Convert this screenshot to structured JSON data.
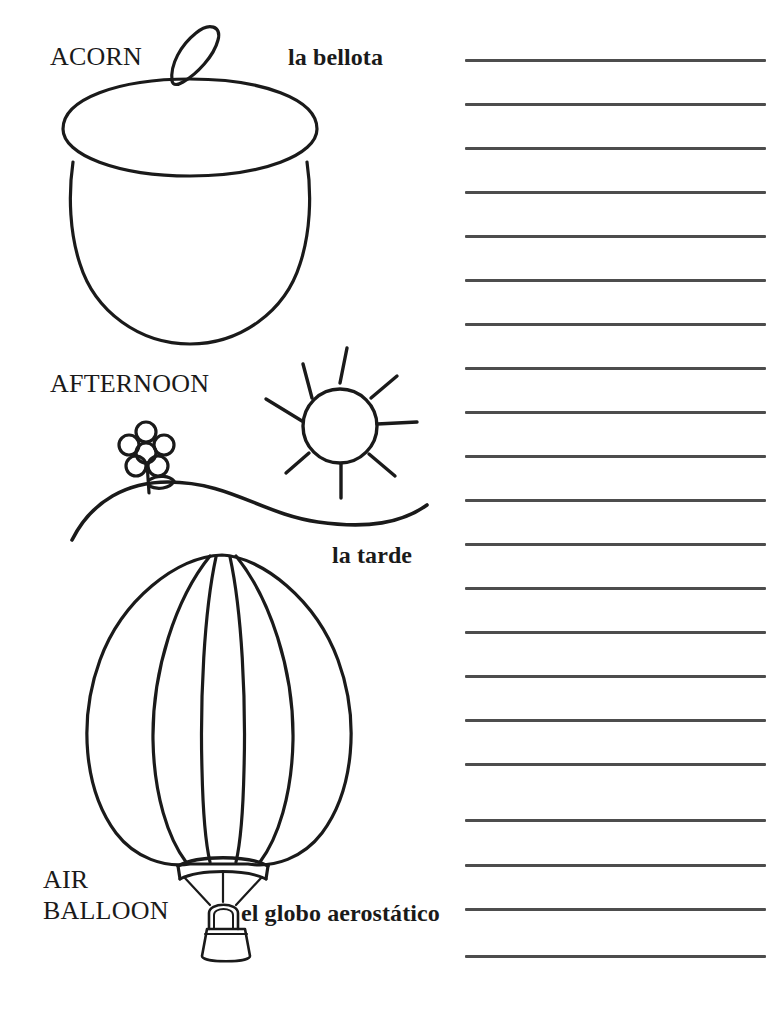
{
  "page": {
    "width": 779,
    "height": 1011,
    "background_color": "#ffffff",
    "ink_color": "#1a1a1a",
    "rule_color": "#4d4d4d",
    "kind": "coloring-and-vocabulary-worksheet"
  },
  "entries": [
    {
      "id": "acorn",
      "english": "ACORN",
      "spanish": "la bellota",
      "illustration": "acorn-drawing",
      "english_pos": {
        "x": 50,
        "y": 43,
        "size": 26
      },
      "spanish_pos": {
        "x": 288,
        "y": 45,
        "size": 24
      }
    },
    {
      "id": "afternoon",
      "english": "AFTERNOON",
      "spanish": "la tarde",
      "illustration": "afternoon-scene-drawing",
      "english_pos": {
        "x": 50,
        "y": 370,
        "size": 26
      },
      "spanish_pos": {
        "x": 332,
        "y": 543,
        "size": 24
      }
    },
    {
      "id": "air-balloon",
      "english": "AIR\nBALLOON",
      "english_line1": "AIR",
      "english_line2": "BALLOON",
      "spanish": "el globo aerostático",
      "illustration": "hot-air-balloon-drawing",
      "english_pos": {
        "x": 43,
        "y": 866,
        "size": 26
      },
      "spanish_pos": {
        "x": 241,
        "y": 901,
        "size": 24
      }
    }
  ],
  "writing_lines": {
    "count": 20,
    "x_start": 465,
    "x_end": 766,
    "thickness": 3,
    "color": "#4d4d4d",
    "y_positions": [
      59,
      103,
      147,
      191,
      235,
      279,
      323,
      367,
      411,
      455,
      499,
      543,
      587,
      631,
      675,
      719,
      763,
      819,
      864,
      908,
      955
    ]
  },
  "illustrations": {
    "acorn": {
      "name": "acorn-drawing",
      "parts": [
        "stem-loop",
        "cap-ellipse",
        "nut-body"
      ]
    },
    "afternoon": {
      "name": "afternoon-scene-drawing",
      "parts": [
        "sun-circle",
        "sun-rays",
        "flower-petals",
        "flower-center",
        "flower-stem",
        "flower-leaf",
        "rolling-hill-curve"
      ],
      "sun_ray_count": 8,
      "flower_petal_count": 5
    },
    "air_balloon": {
      "name": "hot-air-balloon-drawing",
      "parts": [
        "envelope-outline",
        "gore-seams",
        "skirt-ring",
        "suspension-cables",
        "burner-loop",
        "basket"
      ],
      "gore_seam_count": 4,
      "cable_count": 3
    }
  }
}
